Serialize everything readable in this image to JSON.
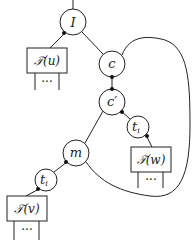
{
  "diagram": {
    "nodes": {
      "I": {
        "label": "I"
      },
      "c": {
        "label": "c"
      },
      "c_prime": {
        "label": "c′"
      },
      "m": {
        "label": "m"
      },
      "t_right": {
        "label": "t",
        "sub": "i"
      },
      "t_left": {
        "label": "t",
        "sub": "i"
      }
    },
    "boxes": {
      "Tu": {
        "label": "𝒯(u)",
        "legs_label": "···"
      },
      "Tw": {
        "label": "𝒯(w)",
        "legs_label": "···"
      },
      "Tv": {
        "label": "𝒯(v)",
        "legs_label": "···"
      }
    },
    "colors": {
      "stroke": "#222222",
      "fill": "#ffffff"
    }
  }
}
